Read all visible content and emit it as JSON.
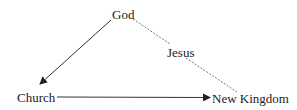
{
  "diagram": {
    "nodes": {
      "god": "God",
      "church": "Church",
      "new_kingdom": "New Kingdom"
    },
    "edges": [
      {
        "from": "God",
        "to": "Church",
        "style": "solid",
        "arrow": true,
        "label": ""
      },
      {
        "from": "Church",
        "to": "New Kingdom",
        "style": "solid",
        "arrow": true,
        "label": ""
      },
      {
        "from": "God",
        "to": "New Kingdom",
        "style": "dashed",
        "arrow": false,
        "label": "Jesus"
      }
    ],
    "edge_label_jesus": "Jesus",
    "colors": {
      "line": "#333333",
      "text": "#222222"
    }
  }
}
